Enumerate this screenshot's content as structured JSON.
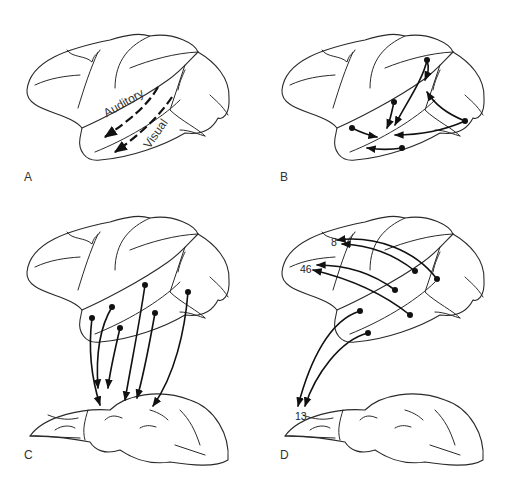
{
  "panels": [
    {
      "id": "A",
      "label": "A",
      "streams": [
        "Auditory",
        "Visual"
      ]
    },
    {
      "id": "B",
      "label": "B"
    },
    {
      "id": "C",
      "label": "C"
    },
    {
      "id": "D",
      "label": "D",
      "areas": [
        "8",
        "46",
        "13"
      ]
    }
  ],
  "colors": {
    "line": "#2a2a2a",
    "arrow": "#111111",
    "background": "#ffffff"
  }
}
